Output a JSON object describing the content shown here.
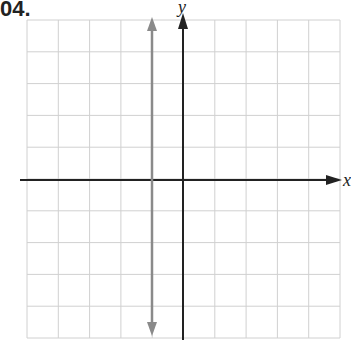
{
  "problem_number": "04.",
  "graph": {
    "x_label": "x",
    "y_label": "y",
    "grid": {
      "columns": 10,
      "rows": 10,
      "x_min": -5,
      "x_max": 5,
      "y_min": -5,
      "y_max": 5,
      "color": "#d0d0d0"
    },
    "axis_color": "#222222",
    "plotted_line": {
      "type": "vertical",
      "equation": "x = -1",
      "color": "#8a8a8a"
    }
  },
  "chart_data": {
    "type": "line",
    "title": "",
    "xlabel": "x",
    "ylabel": "y",
    "xlim": [
      -5,
      5
    ],
    "ylim": [
      -5,
      5
    ],
    "grid": true,
    "series": [
      {
        "name": "x = -1",
        "x": [
          -1,
          -1
        ],
        "y": [
          -5,
          5
        ]
      }
    ]
  }
}
